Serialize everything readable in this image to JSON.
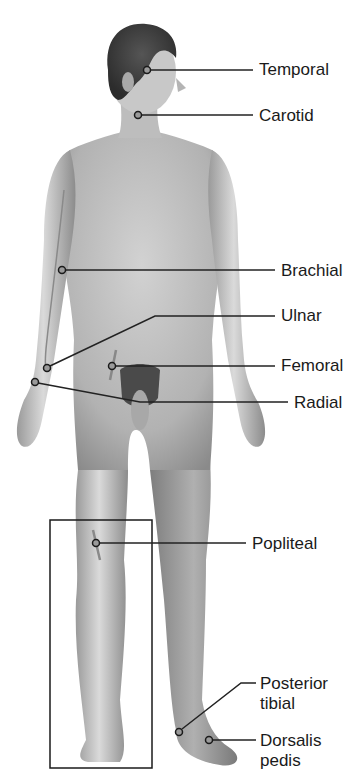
{
  "diagram": {
    "colors": {
      "line": "#222222",
      "skin_light": "#e6e6e6",
      "skin_mid": "#b9b9b9",
      "skin_dark": "#8a8a8a",
      "hair": "#3a3a3a",
      "box": "#1a1a1a"
    },
    "pulse_points": [
      {
        "id": "temporal",
        "label": "Temporal",
        "label_line2": "",
        "point": [
          147,
          70
        ],
        "elbow": null,
        "line_end": [
          253,
          70
        ],
        "label_pos": [
          259,
          60
        ]
      },
      {
        "id": "carotid",
        "label": "Carotid",
        "label_line2": "",
        "point": [
          138,
          115
        ],
        "elbow": null,
        "line_end": [
          253,
          115
        ],
        "label_pos": [
          259,
          106
        ]
      },
      {
        "id": "brachial",
        "label": "Brachial",
        "label_line2": "",
        "point": [
          62,
          270
        ],
        "elbow": null,
        "line_end": [
          275,
          270
        ],
        "label_pos": [
          281,
          261
        ]
      },
      {
        "id": "ulnar",
        "label": "Ulnar",
        "label_line2": "",
        "point": [
          47,
          368
        ],
        "elbow": [
          155,
          316
        ],
        "line_end": [
          275,
          316
        ],
        "label_pos": [
          281,
          306
        ]
      },
      {
        "id": "femoral",
        "label": "Femoral",
        "label_line2": "",
        "point": [
          112,
          366
        ],
        "elbow": null,
        "line_end": [
          275,
          366
        ],
        "label_pos": [
          281,
          356
        ]
      },
      {
        "id": "radial",
        "label": "Radial",
        "label_line2": "",
        "point": [
          35,
          382
        ],
        "elbow": [
          140,
          402
        ],
        "line_end": [
          288,
          402
        ],
        "label_pos": [
          294,
          393
        ]
      },
      {
        "id": "popliteal",
        "label": "Popliteal",
        "label_line2": "",
        "point": [
          96,
          543
        ],
        "elbow": null,
        "line_end": [
          246,
          543
        ],
        "label_pos": [
          252,
          534
        ]
      },
      {
        "id": "posterior-tibial",
        "label": "Posterior",
        "label_line2": "tibial",
        "point": [
          179,
          732
        ],
        "elbow": [
          241,
          683
        ],
        "line_end": [
          256,
          683
        ],
        "label_pos": [
          260,
          674
        ]
      },
      {
        "id": "dorsalis-pedis",
        "label": "Dorsalis",
        "label_line2": "pedis",
        "point": [
          209,
          740
        ],
        "elbow": null,
        "line_end": [
          256,
          740
        ],
        "label_pos": [
          260,
          731
        ]
      }
    ],
    "inset_box": {
      "x": 50,
      "y": 520,
      "width": 102,
      "height": 248,
      "caption": ""
    }
  }
}
